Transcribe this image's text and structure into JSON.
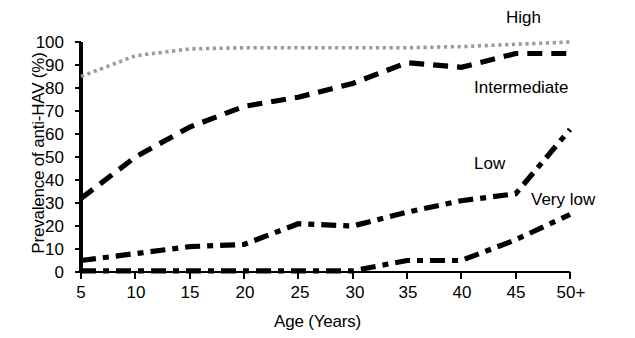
{
  "figure": {
    "background": "#ffffff",
    "x_axis_title": "Age (Years)",
    "y_axis_title": "Prevalence of anti-HAV (%)"
  },
  "axis": {
    "y_ticks": [
      "0",
      "10",
      "20",
      "30",
      "40",
      "50",
      "60",
      "70",
      "80",
      "90",
      "100"
    ],
    "x_ticks": [
      "5",
      "10",
      "15",
      "20",
      "25",
      "30",
      "35",
      "40",
      "45",
      "50+"
    ]
  },
  "labels": {
    "high": "High",
    "intermediate": "Intermediate",
    "low": "Low",
    "very_low": "Very low"
  },
  "colors": {
    "high_line": "#9a9a9a",
    "other_lines": "#000000",
    "axis": "#000000",
    "background": "#ffffff"
  },
  "chart_data": {
    "type": "line",
    "title": "",
    "subtitle": "",
    "xlabel": "Age (Years)",
    "ylabel": "Prevalence of anti-HAV (%)",
    "x": [
      5,
      10,
      15,
      20,
      25,
      30,
      35,
      40,
      45,
      50
    ],
    "xtick_labels": [
      "5",
      "10",
      "15",
      "20",
      "25",
      "30",
      "35",
      "40",
      "45",
      "50+"
    ],
    "xlim": [
      5,
      50
    ],
    "ylim": [
      0,
      100
    ],
    "ytick_values": [
      0,
      10,
      20,
      30,
      40,
      50,
      60,
      70,
      80,
      90,
      100
    ],
    "grid": false,
    "legend": "inline-annotations",
    "series": [
      {
        "name": "High",
        "style": "dotted",
        "color": "#9a9a9a",
        "values": [
          85,
          94,
          97,
          97.5,
          97.5,
          97.5,
          97.5,
          98,
          99,
          100
        ]
      },
      {
        "name": "Intermediate",
        "style": "dashed",
        "color": "#000000",
        "values": [
          32,
          50,
          63,
          72,
          76,
          82,
          91,
          89,
          95,
          95
        ]
      },
      {
        "name": "Low",
        "style": "dash-dot",
        "color": "#000000",
        "values": [
          5,
          8,
          11,
          12,
          21,
          20,
          26,
          31,
          34,
          62
        ]
      },
      {
        "name": "Very low",
        "style": "dash-dot",
        "color": "#000000",
        "values": [
          0.5,
          0.5,
          0.5,
          0.5,
          0.5,
          0.5,
          5,
          5,
          14,
          25
        ]
      }
    ],
    "annotations": [
      {
        "text": "High",
        "x": 46,
        "y": 100
      },
      {
        "text": "Intermediate",
        "x": 42,
        "y": 80
      },
      {
        "text": "Low",
        "x": 41,
        "y": 43
      },
      {
        "text": "Very low",
        "x": 46,
        "y": 32
      }
    ]
  }
}
